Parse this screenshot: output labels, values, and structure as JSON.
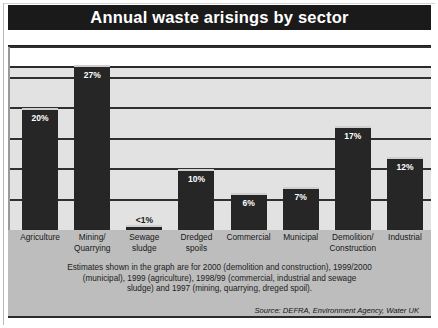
{
  "chart_data": {
    "type": "bar",
    "title": "Annual waste arisings by sector",
    "xlabel": "",
    "ylabel": "",
    "ylim": [
      0,
      30
    ],
    "grid": true,
    "legend_position": "none",
    "categories": [
      "Agriculture",
      "Mining/\nQuarrying",
      "Sewage\nsludge",
      "Dredged\nspoils",
      "Commercial",
      "Municipal",
      "Demolition/\nConstruction",
      "Industrial"
    ],
    "values": [
      20,
      27,
      0.8,
      10,
      6,
      7,
      17,
      12
    ],
    "value_labels": [
      "20%",
      "27%",
      "<1%",
      "10%",
      "6%",
      "7%",
      "17%",
      "12%"
    ],
    "label_placement": [
      "inside",
      "inside",
      "outside",
      "inside",
      "inside",
      "inside",
      "inside",
      "inside"
    ],
    "gridline_values": [
      5,
      10,
      15,
      20,
      25,
      30
    ],
    "annotations": [
      "Estimates shown in the graph are for 2000 (demolition and construction), 1999/2000 (municipal), 1999 (agriculture), 1998/99 (commercial, industrial and sewage sludge) and 1997 (mining, quarrying, dreged spoil)."
    ],
    "source": "Source: DEFRA, Environment Agency, Water UK"
  },
  "figure": {
    "title": "Annual waste arisings by sector",
    "note_lines": [
      "Estimates shown in the graph are for 2000 (demolition and construction), 1999/2000",
      "(municipal), 1999 (agriculture), 1998/99 (commercial, industrial and sewage",
      "sludge) and 1997 (mining, quarrying, dreged spoil)."
    ],
    "source": "Source: DEFRA, Environment Agency, Water UK"
  },
  "colors": {
    "title_bar": "#1a1a1a",
    "title_text": "#ffffff",
    "bar_fill": "#262626",
    "bar_highlight": "#cfcfcf",
    "plot_background": "#e2e2e2",
    "card_background": "#bdbdbd",
    "gridline": "#2f2f2f"
  }
}
